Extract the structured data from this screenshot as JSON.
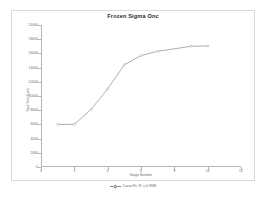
{
  "chart_data": {
    "type": "line",
    "title": "Frozen Sigma Onc",
    "xlabel": "Stage Number",
    "ylabel": "Spot Size (µm)",
    "xlim": [
      0,
      12
    ],
    "ylim": [
      0,
      20000
    ],
    "grid": false,
    "legend_position": "bottom",
    "x_ticks": [
      "0",
      "2",
      "4",
      "6",
      "8",
      "10",
      "12"
    ],
    "y_ticks": [
      "0",
      "2000",
      "4000",
      "6000",
      "8000",
      "10000",
      "12000",
      "14000",
      "16000",
      "18000",
      "20000"
    ],
    "series": [
      {
        "name": "Spot Size - Curve Fit (R² = 0.9986)",
        "color": "#8c8c8c",
        "marker": "diamond",
        "x": [
          1,
          2,
          3,
          4,
          5,
          6,
          7,
          9,
          10
        ],
        "values": [
          6000,
          6000,
          8100,
          11000,
          14400,
          15700,
          16300,
          17000,
          17050
        ]
      }
    ]
  },
  "legend": {
    "entries": [
      {
        "label": "Curve Fit, R² = 0.9986"
      }
    ]
  }
}
